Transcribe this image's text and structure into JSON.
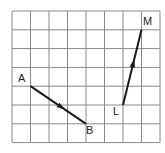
{
  "diagram": {
    "type": "vector-grid",
    "grid": {
      "columns": 8,
      "rows": 7,
      "origin_px": [
        12,
        11
      ],
      "cell_w": 18.5,
      "cell_h": 18.8,
      "line_color": "#8a8a8a"
    },
    "vectors": [
      {
        "name": "AB",
        "from": {
          "label": "A",
          "col": 1,
          "row": 4
        },
        "to": {
          "label": "B",
          "col": 4,
          "row": 6
        },
        "color": "#1a1a1a"
      },
      {
        "name": "LM",
        "from": {
          "label": "L",
          "col": 6,
          "row": 5
        },
        "to": {
          "label": "M",
          "col": 7,
          "row": 1
        },
        "color": "#1a1a1a"
      }
    ],
    "labels": {
      "A": "A",
      "B": "B",
      "L": "L",
      "M": "M"
    }
  }
}
